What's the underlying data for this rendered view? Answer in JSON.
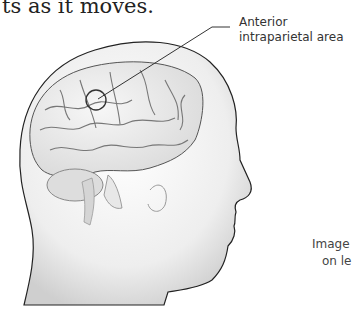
{
  "body_text": "ts as it moves.",
  "figure": {
    "callout_label_line1": "Anterior",
    "callout_label_line2": "intraparietal area",
    "caption_line1": "Image",
    "caption_line2": "on le"
  },
  "colors": {
    "line": "#333333",
    "head_fill": "#f0f0f0",
    "head_edge": "#222222",
    "brain_fill": "#e6e6e6",
    "sulci": "#777777"
  }
}
